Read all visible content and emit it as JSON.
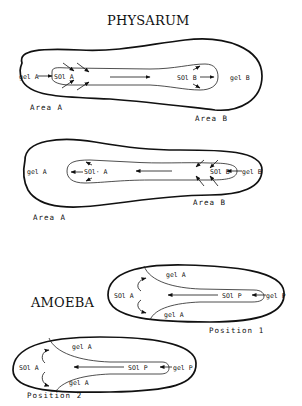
{
  "physarum": {
    "title": "PHYSARUM",
    "diagram1": {
      "gel_a": "gel A",
      "sol_a": "SOl A",
      "sol_b": "SOl B",
      "gel_b": "gel B",
      "area_a": "Area A",
      "area_b": "Area B"
    },
    "diagram2": {
      "gel_a": "gel A",
      "sol_a": "SOl· A",
      "sol_b": "SOl B",
      "gel_b": "gel B",
      "area_a": "Area A",
      "area_b": "Area B"
    }
  },
  "amoeba": {
    "title": "AMOEBA",
    "position1": {
      "gel_a_top": "gel A",
      "gel_a_bottom": "gel A",
      "sol_a": "SOl A",
      "sol_p": "SOl P",
      "gel_p": "gel P",
      "caption": "Position 1"
    },
    "position2": {
      "gel_a_top": "gel A",
      "gel_a_bottom": "gel A",
      "sol_a": "SOl A",
      "sol_p": "SOl P",
      "gel_p": "gel P",
      "caption": "Position 2"
    }
  }
}
